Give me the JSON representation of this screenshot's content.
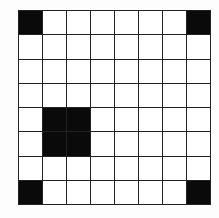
{
  "grid": {
    "rows": 8,
    "cols": 8,
    "filled_color": "#0a0a0a",
    "empty_color": "#ffffff",
    "line_color": "#222222",
    "filled_cells": [
      [
        0,
        0
      ],
      [
        0,
        7
      ],
      [
        4,
        1
      ],
      [
        4,
        2
      ],
      [
        5,
        1
      ],
      [
        5,
        2
      ],
      [
        7,
        0
      ],
      [
        7,
        7
      ]
    ]
  }
}
